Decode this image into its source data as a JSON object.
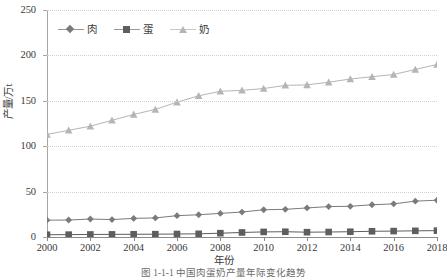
{
  "figure": {
    "caption": "图 1-1-1   中国肉蛋奶产量年际变化趋势"
  },
  "axes": {
    "y_title": "产量/万t",
    "x_title": "年份",
    "y_ticks": [
      "0",
      "50",
      "100",
      "150",
      "200",
      "250"
    ],
    "x_ticks": [
      "2000",
      "2002",
      "2004",
      "2006",
      "2008",
      "2010",
      "2012",
      "2014",
      "2016",
      "2018"
    ]
  },
  "legend": {
    "items": [
      {
        "label": "肉",
        "marker": "diamond-marker-icon",
        "color": "#7b7b7b"
      },
      {
        "label": "蛋",
        "marker": "square-marker-icon",
        "color": "#5e5e5e"
      },
      {
        "label": "奶",
        "marker": "triangle-marker-icon",
        "color": "#b5b5b5"
      }
    ]
  },
  "chart_data": {
    "type": "line",
    "title": "",
    "xlabel": "年份",
    "ylabel": "产量/万t",
    "xlim": [
      2000,
      2018
    ],
    "ylim": [
      0,
      250
    ],
    "ytick_step": 50,
    "xtick_step": 2,
    "grid": true,
    "legend_position": "top-left",
    "x": [
      2000,
      2001,
      2002,
      2003,
      2004,
      2005,
      2006,
      2007,
      2008,
      2009,
      2010,
      2011,
      2012,
      2013,
      2014,
      2015,
      2016,
      2017,
      2018
    ],
    "series": [
      {
        "name": "肉",
        "marker": "diamond",
        "color": "#7b7b7b",
        "values": [
          18.5,
          18.7,
          19.8,
          19.2,
          20.5,
          21.0,
          23.5,
          24.5,
          26.0,
          27.5,
          30.0,
          30.5,
          32.0,
          33.5,
          33.8,
          35.5,
          36.5,
          39.5,
          40.5
        ]
      },
      {
        "name": "蛋",
        "marker": "square",
        "color": "#5e5e5e",
        "values": [
          2.5,
          2.6,
          2.8,
          2.9,
          3.0,
          3.1,
          3.3,
          3.5,
          4.2,
          5.0,
          5.6,
          5.8,
          5.3,
          5.5,
          5.8,
          6.3,
          6.5,
          6.8,
          7.0
        ]
      },
      {
        "name": "奶",
        "marker": "triangle",
        "color": "#b5b5b5",
        "values": [
          113.0,
          117.5,
          122.0,
          128.5,
          135.0,
          140.5,
          148.5,
          155.5,
          160.5,
          161.5,
          163.5,
          167.0,
          167.5,
          170.5,
          174.0,
          176.5,
          179.0,
          184.5,
          190.0
        ]
      }
    ]
  }
}
